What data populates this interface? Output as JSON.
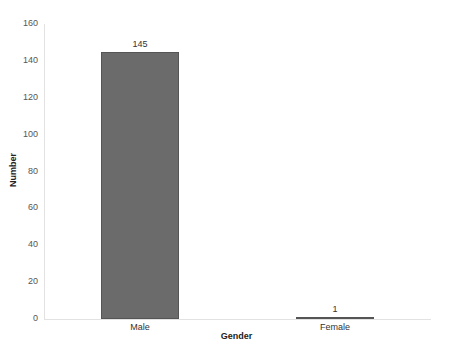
{
  "chart_data": {
    "type": "bar",
    "title": "",
    "xlabel": "Gender",
    "ylabel": "Number",
    "categories": [
      "Male",
      "Female"
    ],
    "values": [
      145,
      1
    ],
    "data_labels": [
      "145",
      "1"
    ],
    "ylim": [
      0,
      160
    ],
    "yticks": [
      0,
      20,
      40,
      60,
      80,
      100,
      120,
      140,
      160
    ],
    "grid": false,
    "legend": null,
    "bar_color": "#6b6b6b"
  }
}
